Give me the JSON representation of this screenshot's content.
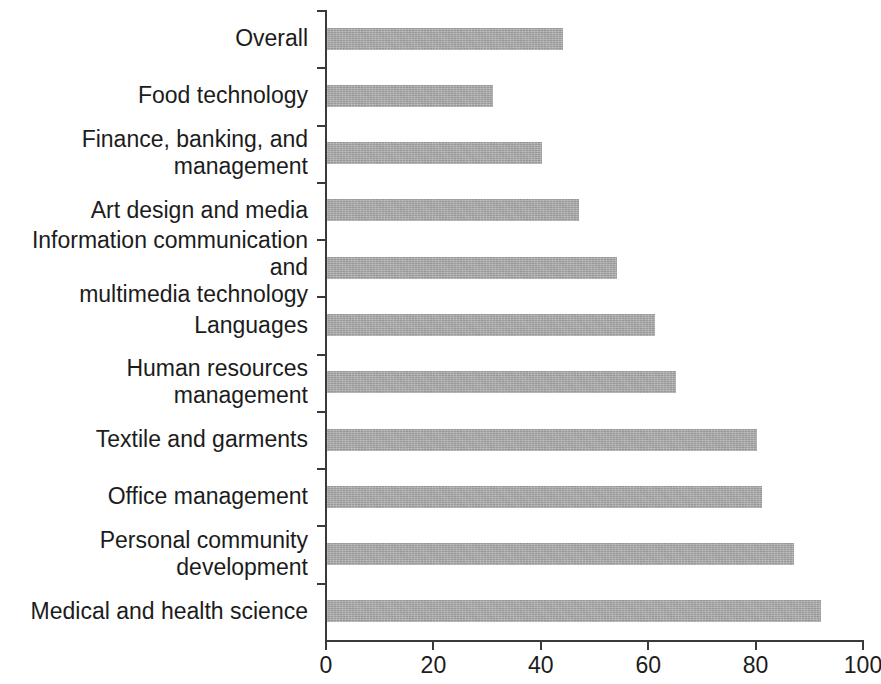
{
  "chart_data": {
    "type": "bar",
    "orientation": "horizontal",
    "title": "",
    "subtitle": "",
    "xlabel": "",
    "ylabel": "",
    "xlim": [
      0,
      100
    ],
    "grid": false,
    "legend": null,
    "bar_color": "#a9a9a9",
    "axis_color": "#3a3a3a",
    "xticks": [
      0,
      20,
      40,
      60,
      80,
      100
    ],
    "xtick_labels": [
      "0",
      "20",
      "40",
      "60",
      "80",
      "100"
    ],
    "categories": [
      "Overall",
      "Food technology",
      "Finance, banking, and management",
      "Art design and media",
      "Information communication and\nmultimedia technology",
      "Languages",
      "Human resources management",
      "Textile and garments",
      "Office management",
      "Personal community development",
      "Medical and health science"
    ],
    "values": [
      44,
      31,
      40,
      47,
      54,
      61,
      65,
      80,
      81,
      87,
      92
    ]
  }
}
